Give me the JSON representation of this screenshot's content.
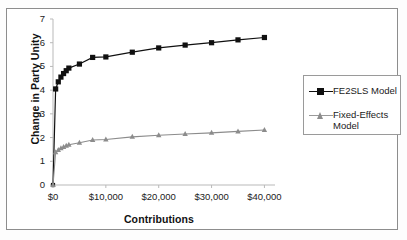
{
  "chart_data": {
    "type": "line",
    "title": "",
    "xlabel": "Contributions",
    "ylabel": "Change in Party Unity",
    "xlim": [
      0,
      42000
    ],
    "ylim": [
      0,
      7
    ],
    "grid": false,
    "legend_position": "right",
    "x_tick_labels": [
      "$0",
      "$10,000",
      "$20,000",
      "$30,000",
      "$40,000"
    ],
    "x_tick_values": [
      0,
      10000,
      20000,
      30000,
      40000
    ],
    "y_tick_labels": [
      "0",
      "1",
      "2",
      "3",
      "4",
      "5",
      "6",
      "7"
    ],
    "y_tick_values": [
      0,
      1,
      2,
      3,
      4,
      5,
      6,
      7
    ],
    "series": [
      {
        "name": "FE2SLS Model",
        "marker": "square",
        "color": "#101010",
        "x": [
          0,
          500,
          1000,
          1500,
          2000,
          2500,
          3000,
          5000,
          7500,
          10000,
          15000,
          20000,
          25000,
          30000,
          35000,
          40000
        ],
        "y": [
          0.0,
          4.05,
          4.35,
          4.55,
          4.7,
          4.82,
          4.93,
          5.1,
          5.38,
          5.4,
          5.6,
          5.78,
          5.9,
          6.0,
          6.12,
          6.22
        ]
      },
      {
        "name": "Fixed-Effects Model",
        "marker": "triangle",
        "color": "#8c8c8c",
        "x": [
          0,
          500,
          1000,
          1500,
          2000,
          2500,
          3000,
          5000,
          7500,
          10000,
          15000,
          20000,
          25000,
          30000,
          35000,
          40000
        ],
        "y": [
          0.0,
          1.38,
          1.48,
          1.55,
          1.6,
          1.65,
          1.7,
          1.78,
          1.9,
          1.92,
          2.03,
          2.1,
          2.15,
          2.2,
          2.26,
          2.32
        ]
      }
    ]
  },
  "legend": {
    "items": [
      {
        "label": "FE2SLS Model",
        "color": "#101010",
        "marker": "square"
      },
      {
        "label": "Fixed-Effects Model",
        "color": "#8c8c8c",
        "marker": "triangle"
      }
    ]
  }
}
